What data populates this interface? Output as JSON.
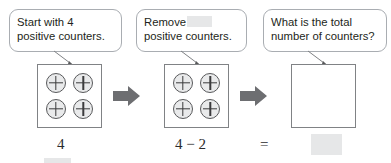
{
  "figure": {
    "background_color": "#ffffff"
  },
  "colors": {
    "text": "#231f20",
    "bubble_border": "#a9adb2",
    "box_border": "#808285",
    "counter_fill": "#e9eaeb",
    "counter_stroke": "#58595b",
    "arrow_fill": "#6d6e71",
    "blank_fill": "#e6e7e8",
    "tail_stroke": "#808285"
  },
  "panels": [
    {
      "id": "panel-1",
      "callout": {
        "line1": "Start with 4",
        "line2": "positive counters.",
        "has_inline_blank": false
      },
      "box": {
        "counters": 4,
        "counter_sign": "+",
        "empty": false
      },
      "label": "4"
    },
    {
      "id": "panel-2",
      "callout": {
        "line1": "Remove",
        "line1_blank": "",
        "line2": "positive counters.",
        "has_inline_blank": true
      },
      "box": {
        "counters": 4,
        "counter_sign": "+",
        "empty": false
      },
      "label": "4 − 2"
    },
    {
      "id": "panel-3",
      "callout": {
        "line1": "What is the total",
        "line2": "number of counters?",
        "has_inline_blank": false
      },
      "box": {
        "counters": 0,
        "counter_sign": "+",
        "empty": true
      },
      "label": "="
    }
  ],
  "arrows": [
    {
      "id": "arrow-1",
      "direction": "right",
      "icon": "block-arrow-right-icon"
    },
    {
      "id": "arrow-2",
      "direction": "right",
      "icon": "block-arrow-right-icon"
    }
  ],
  "answer_blank": {
    "value": "",
    "filled": false
  },
  "extra_blank": {
    "value": "",
    "filled": false
  }
}
